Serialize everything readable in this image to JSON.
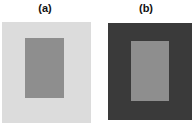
{
  "figure": {
    "type": "simultaneous-contrast-illustration",
    "panels": [
      {
        "label": "(a)",
        "surround_color": "#dcdcdc",
        "center_color": "#8e8e8e"
      },
      {
        "label": "(b)",
        "surround_color": "#3a3a3a",
        "center_color": "#8e8e8e"
      }
    ]
  }
}
